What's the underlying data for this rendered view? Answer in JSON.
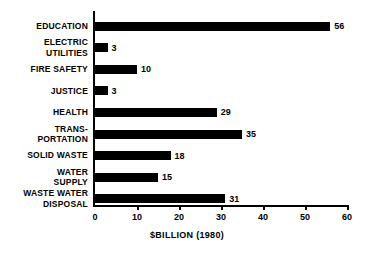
{
  "chart_data": {
    "type": "bar",
    "orientation": "horizontal",
    "title": "",
    "xlabel": "$BILLION (1980)",
    "ylabel": "",
    "xlim": [
      0,
      60
    ],
    "xticks": [
      0,
      10,
      20,
      30,
      40,
      50,
      60
    ],
    "grid": false,
    "legend": null,
    "bar_color": "#000000",
    "background_color": "#ffffff",
    "categories": [
      "EDUCATION",
      "ELECTRIC\nUTILITIES",
      "FIRE SAFETY",
      "JUSTICE",
      "HEALTH",
      "TRANS-\nPORTATION",
      "SOLID WASTE",
      "WATER\nSUPPLY",
      "WASTE WATER\nDISPOSAL"
    ],
    "values": [
      56,
      3,
      10,
      3,
      29,
      35,
      18,
      15,
      31
    ],
    "data_labels": [
      "56",
      "3",
      "10",
      "3",
      "29",
      "35",
      "18",
      "15",
      "31"
    ]
  }
}
